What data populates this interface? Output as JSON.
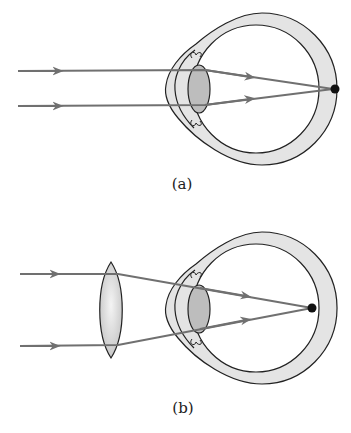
{
  "figure": {
    "panels": [
      {
        "id": "a",
        "caption": "(a)",
        "description": "Parallel rays focused behind the retina (hyperopia)"
      },
      {
        "id": "b",
        "caption": "(b)",
        "description": "Converging lens corrects focus onto the retina"
      }
    ],
    "colors": {
      "ray": "#707070",
      "sclera_fill": "#e4e4e4",
      "lens_fill": "#bdbdbd",
      "outline": "#222222",
      "focus_dot": "#111111"
    }
  }
}
